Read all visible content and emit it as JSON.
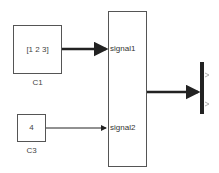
{
  "blocks": {
    "c1": {
      "value": "[1 2 3]",
      "name": "C1"
    },
    "c3": {
      "value": "4",
      "name": "C3"
    },
    "bus_creator": {
      "inputs": [
        "signal1",
        "signal2"
      ]
    }
  },
  "colors": {
    "line": "#222222",
    "border": "#555555",
    "bus": "#222222"
  }
}
